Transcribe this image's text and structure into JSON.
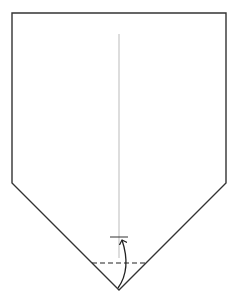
{
  "diagram": {
    "type": "origami-fold-step",
    "canvas": {
      "width": 234,
      "height": 304,
      "background": "#ffffff"
    },
    "colors": {
      "outline": "#333333",
      "center_crease": "#bbbbbb",
      "fold_line": "#222222",
      "arrow": "#222222"
    },
    "shape": {
      "name": "pentagon-paper",
      "points": [
        [
          12,
          13
        ],
        [
          226,
          13
        ],
        [
          226,
          183
        ],
        [
          119,
          290
        ],
        [
          12,
          183
        ]
      ]
    },
    "center_crease": {
      "x": 119,
      "y1": 34,
      "y2": 258
    },
    "valley_fold_line": {
      "x1": 92,
      "y1": 263,
      "x2": 146,
      "y2": 263,
      "style": "dashed"
    },
    "target_mark": {
      "x1": 110,
      "x2": 128,
      "y": 237
    },
    "fold_arrow": {
      "from": [
        118,
        288
      ],
      "to": [
        122,
        240
      ],
      "direction": "fold-up"
    }
  }
}
